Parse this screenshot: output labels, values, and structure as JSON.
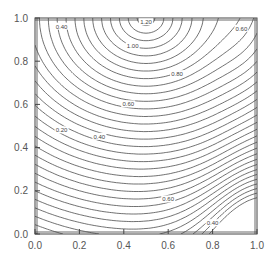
{
  "chart_data": {
    "type": "contour",
    "title": "",
    "xlabel": "",
    "ylabel": "",
    "xlim": [
      0.0,
      1.0
    ],
    "ylim": [
      0.0,
      1.0
    ],
    "grid": false,
    "legend": null,
    "x_ticks": [
      "0.0",
      "0.2",
      "0.4",
      "0.6",
      "0.8",
      "1.0"
    ],
    "y_ticks": [
      "0.0",
      "0.2",
      "0.4",
      "0.6",
      "0.8",
      "1.0"
    ],
    "contour_labels": [
      {
        "text": "0.40",
        "x": 0.12,
        "y": 0.96
      },
      {
        "text": "1.00",
        "x": 0.44,
        "y": 0.87
      },
      {
        "text": "1.20",
        "x": 0.5,
        "y": 0.98
      },
      {
        "text": "0.60",
        "x": 0.93,
        "y": 0.95
      },
      {
        "text": "0.80",
        "x": 0.64,
        "y": 0.74
      },
      {
        "text": "0.60",
        "x": 0.42,
        "y": 0.6
      },
      {
        "text": "0.20",
        "x": 0.12,
        "y": 0.48
      },
      {
        "text": "0.40",
        "x": 0.29,
        "y": 0.45
      },
      {
        "text": "0.60",
        "x": 0.6,
        "y": 0.16
      },
      {
        "text": "0.40",
        "x": 0.8,
        "y": 0.05
      }
    ],
    "features": {
      "peak": {
        "x": 0.5,
        "y": 1.0,
        "value_approx": 1.3
      },
      "saddle": {
        "x": 0.85,
        "y": 0.58,
        "value_approx": 0.7
      },
      "low_corners": [
        [
          0.0,
          0.0
        ],
        [
          1.0,
          0.0
        ]
      ]
    }
  }
}
